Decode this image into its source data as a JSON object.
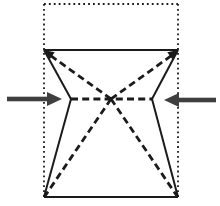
{
  "figure": {
    "background_color": "#ffffff",
    "line_color": "#1b1b1b",
    "arrow_color": "#3f3f3f",
    "canvas": {
      "width": 220,
      "height": 206
    },
    "segments": [
      {
        "name": "paper-outline-top-dotted",
        "style": "dotted",
        "x1": 44,
        "y1": 4,
        "x2": 178,
        "y2": 4
      },
      {
        "name": "paper-outline-left-dotted",
        "style": "dotted",
        "x1": 44,
        "y1": 4,
        "x2": 44,
        "y2": 197
      },
      {
        "name": "paper-outline-right-dotted",
        "style": "dotted",
        "x1": 178,
        "y1": 4,
        "x2": 178,
        "y2": 197
      },
      {
        "name": "top-edge-solid",
        "style": "solid",
        "x1": 44,
        "y1": 50,
        "x2": 178,
        "y2": 50,
        "w": 2
      },
      {
        "name": "bottom-edge-solid",
        "style": "solid",
        "x1": 44,
        "y1": 197,
        "x2": 178,
        "y2": 197,
        "w": 2.4
      },
      {
        "name": "left-upper-edge-solid",
        "style": "solid",
        "x1": 44,
        "y1": 50,
        "x2": 71,
        "y2": 99,
        "w": 1.8
      },
      {
        "name": "left-lower-edge-solid",
        "style": "solid",
        "x1": 71,
        "y1": 99,
        "x2": 44,
        "y2": 197,
        "w": 1.8
      },
      {
        "name": "right-upper-edge-solid",
        "style": "solid",
        "x1": 178,
        "y1": 50,
        "x2": 152,
        "y2": 99,
        "w": 1.8
      },
      {
        "name": "right-lower-edge-solid",
        "style": "solid",
        "x1": 152,
        "y1": 99,
        "x2": 178,
        "y2": 197,
        "w": 1.8
      },
      {
        "name": "crease-top-left-dashed",
        "style": "dashed",
        "x1": 111,
        "y1": 99,
        "x2": 47,
        "y2": 53
      },
      {
        "name": "crease-top-right-dashed",
        "style": "dashed",
        "x1": 111,
        "y1": 99,
        "x2": 175,
        "y2": 53
      },
      {
        "name": "crease-bottom-left-dashed",
        "style": "dashed",
        "x1": 111,
        "y1": 99,
        "x2": 45,
        "y2": 196
      },
      {
        "name": "crease-bottom-right-dashed",
        "style": "dashed",
        "x1": 111,
        "y1": 99,
        "x2": 177,
        "y2": 196
      },
      {
        "name": "crease-horizontal-dashed",
        "style": "dashed",
        "x1": 71,
        "y1": 99,
        "x2": 152,
        "y2": 99
      }
    ],
    "arrows": [
      {
        "name": "push-arrow-left",
        "tip": [
          62,
          99
        ],
        "angle": 0,
        "head_len": 15,
        "head_w": 14,
        "shaft_len": 40,
        "shaft_w": 4.6,
        "color": "#3f3f3f"
      },
      {
        "name": "push-arrow-right",
        "tip": [
          164,
          100
        ],
        "angle": 180,
        "head_len": 15,
        "head_w": 14,
        "shaft_len": 37,
        "shaft_w": 4.6,
        "color": "#3f3f3f"
      },
      {
        "name": "fold-arrowhead-top-left",
        "tip": [
          44,
          50
        ],
        "angle": 216,
        "head_len": 10,
        "head_w": 9,
        "shaft_len": 0,
        "shaft_w": 0,
        "color": "#1b1b1b"
      },
      {
        "name": "fold-arrowhead-top-right",
        "tip": [
          178,
          50
        ],
        "angle": -36,
        "head_len": 10,
        "head_w": 9,
        "shaft_len": 0,
        "shaft_w": 0,
        "color": "#1b1b1b"
      }
    ]
  }
}
